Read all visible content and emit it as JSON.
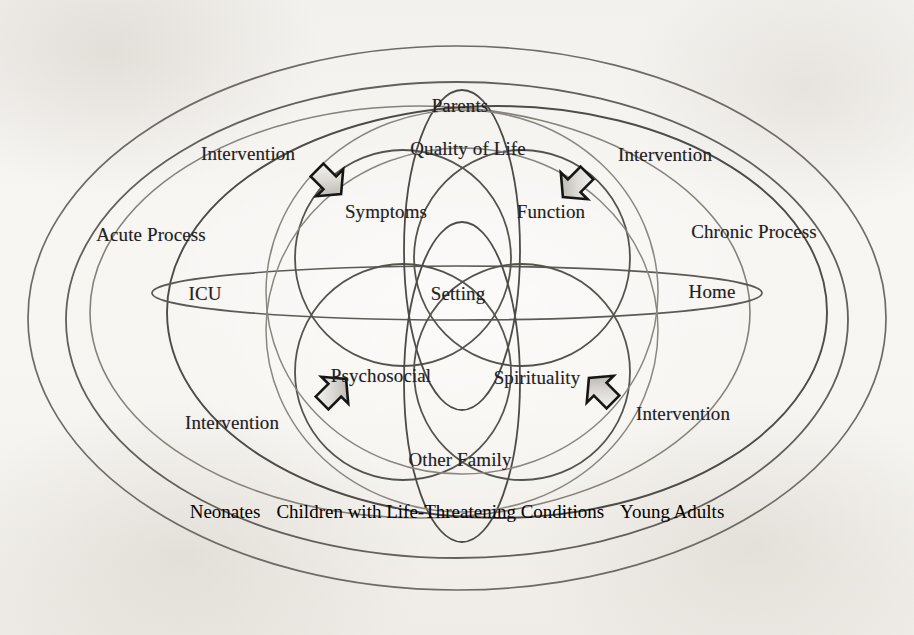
{
  "figure": {
    "type": "venn-nested-ellipse-diagram",
    "title_visible": false,
    "background_color": "#f6f4f1",
    "ink_color": "#5e5a55"
  },
  "outer_rings": {
    "left_label": "Acute Process",
    "right_label": "Chronic Process"
  },
  "setting_axis": {
    "left_label": "ICU",
    "center_label": "Setting",
    "right_label": "Home"
  },
  "domains": {
    "top_center": "Parents",
    "upper_center": "Quality of Life",
    "upper_left": "Symptoms",
    "upper_right": "Function",
    "lower_left": "Psychosocial",
    "lower_right": "Spirituality",
    "bottom_center": "Other Family"
  },
  "interventions": [
    {
      "id": "top-left",
      "label": "Intervention",
      "direction": "down-right"
    },
    {
      "id": "top-right",
      "label": "Intervention",
      "direction": "down-left"
    },
    {
      "id": "bottom-left",
      "label": "Intervention",
      "direction": "up-right"
    },
    {
      "id": "bottom-right",
      "label": "Intervention",
      "direction": "up-left"
    }
  ],
  "caption": {
    "left": "Neonates",
    "center": "Children with Life-Threatening Conditions",
    "right": "Young Adults"
  }
}
